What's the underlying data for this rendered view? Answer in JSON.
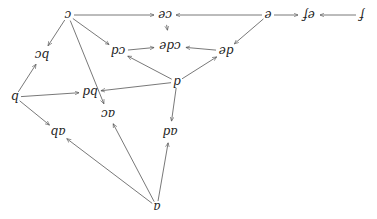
{
  "diagram": {
    "orientation": "rotated-180",
    "nodes": [
      {
        "id": "c",
        "label": "c",
        "x": 68,
        "y": 15
      },
      {
        "id": "ce",
        "label": "ce",
        "x": 165,
        "y": 15
      },
      {
        "id": "e",
        "label": "e",
        "x": 268,
        "y": 15
      },
      {
        "id": "ef",
        "label": "ef",
        "x": 309,
        "y": 15
      },
      {
        "id": "f",
        "label": "f",
        "x": 362,
        "y": 15
      },
      {
        "id": "cd",
        "label": "cd",
        "x": 118,
        "y": 51
      },
      {
        "id": "cde",
        "label": "cde",
        "x": 170,
        "y": 46
      },
      {
        "id": "de",
        "label": "de",
        "x": 226,
        "y": 51
      },
      {
        "id": "bc",
        "label": "bc",
        "x": 42,
        "y": 55
      },
      {
        "id": "d",
        "label": "d",
        "x": 177,
        "y": 82
      },
      {
        "id": "bd",
        "label": "bd",
        "x": 90,
        "y": 92
      },
      {
        "id": "b",
        "label": "b",
        "x": 15,
        "y": 97
      },
      {
        "id": "ac",
        "label": "ac",
        "x": 108,
        "y": 114
      },
      {
        "id": "ab",
        "label": "ab",
        "x": 58,
        "y": 132
      },
      {
        "id": "ad",
        "label": "ad",
        "x": 170,
        "y": 132
      },
      {
        "id": "a",
        "label": "a",
        "x": 157,
        "y": 207
      }
    ],
    "edges": [
      {
        "from": "c",
        "to": "ce"
      },
      {
        "from": "e",
        "to": "ce"
      },
      {
        "from": "e",
        "to": "ef"
      },
      {
        "from": "f",
        "to": "ef"
      },
      {
        "from": "ce",
        "to": "cde"
      },
      {
        "from": "c",
        "to": "cd"
      },
      {
        "from": "cd",
        "to": "cde"
      },
      {
        "from": "de",
        "to": "cde"
      },
      {
        "from": "e",
        "to": "de"
      },
      {
        "from": "d",
        "to": "cd"
      },
      {
        "from": "d",
        "to": "de"
      },
      {
        "from": "c",
        "to": "bc"
      },
      {
        "from": "b",
        "to": "bc"
      },
      {
        "from": "b",
        "to": "bd"
      },
      {
        "from": "d",
        "to": "bd"
      },
      {
        "from": "c",
        "to": "ac"
      },
      {
        "from": "b",
        "to": "ab"
      },
      {
        "from": "d",
        "to": "ad"
      },
      {
        "from": "a",
        "to": "ab"
      },
      {
        "from": "a",
        "to": "ac"
      },
      {
        "from": "a",
        "to": "ad"
      }
    ]
  }
}
